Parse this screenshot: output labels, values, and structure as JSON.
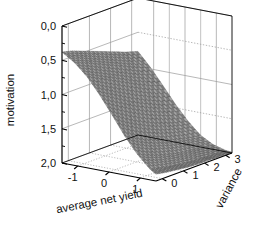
{
  "chart_data": {
    "type": "surface",
    "title": "",
    "projection": "3d-surface-mesh",
    "xlabel": "average net yield",
    "ylabel": "variance",
    "zlabel": "motivation",
    "x_ticks": [
      "-1",
      "0",
      "1"
    ],
    "x_tick_values": [
      -1,
      0,
      1
    ],
    "y_ticks": [
      "0",
      "1",
      "2",
      "3"
    ],
    "y_tick_values": [
      0,
      1,
      2,
      3
    ],
    "z_ticks": [
      "0,0",
      "0,5",
      "1,0",
      "1,5",
      "2,0"
    ],
    "z_tick_values": [
      0.0,
      0.5,
      1.0,
      1.5,
      2.0
    ],
    "xlim": [
      -1.5,
      1.5
    ],
    "ylim": [
      -0.3,
      3.3
    ],
    "zlim": [
      0.0,
      2.0
    ],
    "grid": true,
    "legend": "none",
    "surface_color": "#8a8a8a",
    "mesh_color": "#3a3a3a",
    "axis_color": "#000000",
    "gridline_color": "#9a9a9a",
    "x": [
      -1.5,
      -1.1,
      -0.7,
      -0.3,
      0.1,
      0.5,
      0.9,
      1.3,
      1.5
    ],
    "y": [
      -0.3,
      0.2,
      0.7,
      1.2,
      1.7,
      2.2,
      2.7,
      3.3
    ],
    "z": [
      [
        1.62,
        1.58,
        1.52,
        1.46,
        1.4,
        1.34,
        1.28,
        1.22
      ],
      [
        1.5,
        1.44,
        1.37,
        1.3,
        1.23,
        1.16,
        1.09,
        1.02
      ],
      [
        1.33,
        1.25,
        1.17,
        1.09,
        1.01,
        0.93,
        0.86,
        0.79
      ],
      [
        1.1,
        1.01,
        0.92,
        0.83,
        0.75,
        0.68,
        0.61,
        0.55
      ],
      [
        0.84,
        0.74,
        0.65,
        0.57,
        0.5,
        0.44,
        0.39,
        0.34
      ],
      [
        0.57,
        0.48,
        0.4,
        0.34,
        0.28,
        0.24,
        0.2,
        0.17
      ],
      [
        0.34,
        0.27,
        0.21,
        0.17,
        0.13,
        0.11,
        0.09,
        0.07
      ],
      [
        0.16,
        0.12,
        0.09,
        0.06,
        0.05,
        0.04,
        0.03,
        0.02
      ],
      [
        0.1,
        0.07,
        0.05,
        0.03,
        0.02,
        0.02,
        0.01,
        0.01
      ]
    ]
  },
  "axes": {
    "z_axis": {
      "title": "motivation",
      "ticks": [
        "2,0",
        "1,5",
        "1,0",
        "0,5",
        "0,0"
      ]
    },
    "x_axis": {
      "title": "average net yield",
      "ticks": [
        "-1",
        "0",
        "1"
      ]
    },
    "y_axis": {
      "title": "variance",
      "ticks": [
        "0",
        "1",
        "2",
        "3"
      ]
    }
  }
}
